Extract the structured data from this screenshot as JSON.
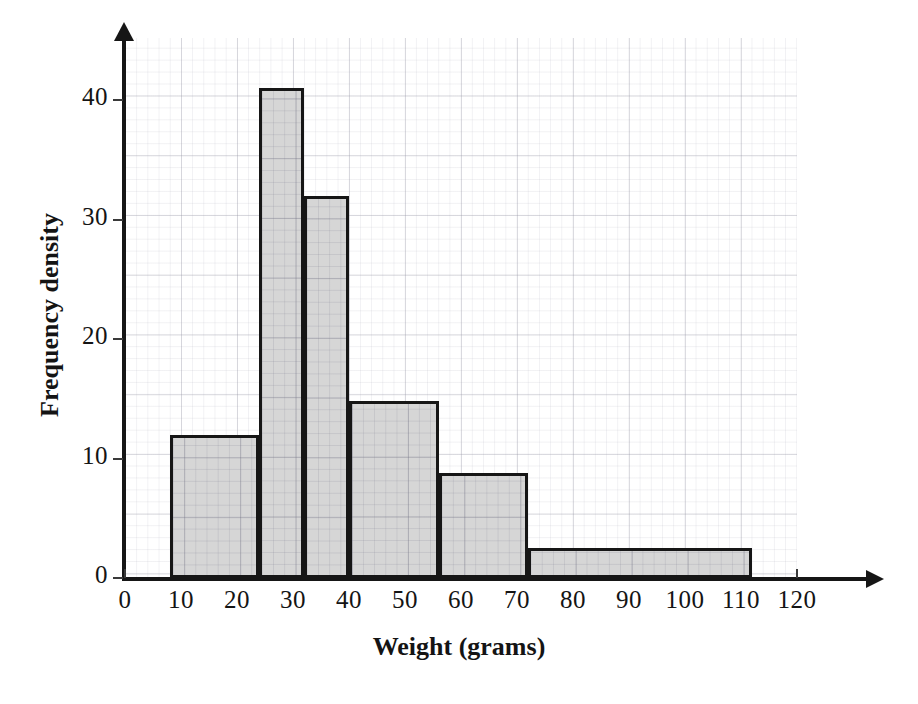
{
  "chart_data": {
    "type": "bar",
    "title": "",
    "xlabel": "Weight (grams)",
    "ylabel": "Frequency density",
    "xlim": [
      0,
      125
    ],
    "ylim": [
      0,
      45
    ],
    "grid": true,
    "legend": "none",
    "x_ticks": [
      "0",
      "10",
      "20",
      "30",
      "40",
      "50",
      "60",
      "70",
      "80",
      "90",
      "100",
      "110",
      "120"
    ],
    "x_tick_values": [
      0,
      10,
      20,
      30,
      40,
      50,
      60,
      70,
      80,
      90,
      100,
      110,
      120
    ],
    "y_ticks": [
      "0",
      "10",
      "20",
      "30",
      "40"
    ],
    "y_tick_values": [
      0,
      10,
      20,
      30,
      40
    ],
    "bins": [
      {
        "label": "8-24",
        "start": 8,
        "end": 24,
        "value": 12.0
      },
      {
        "label": "24-32",
        "start": 24,
        "end": 32,
        "value": 41.0
      },
      {
        "label": "32-40",
        "start": 32,
        "end": 40,
        "value": 32.0
      },
      {
        "label": "40-56",
        "start": 40,
        "end": 56,
        "value": 14.8
      },
      {
        "label": "56-72",
        "start": 56,
        "end": 72,
        "value": 8.8
      },
      {
        "label": "72-112",
        "start": 72,
        "end": 112,
        "value": 2.5
      }
    ],
    "categories": [
      "8-24",
      "24-32",
      "32-40",
      "40-56",
      "56-72",
      "72-112"
    ],
    "values": [
      12.0,
      41.0,
      32.0,
      14.8,
      8.8,
      2.5
    ],
    "colors": {
      "bar_fill": "#d6d6d6",
      "bar_stroke": "#161616",
      "axis": "#161616",
      "grid": "#9696a5",
      "background": "#ffffff",
      "text": "#141414"
    }
  }
}
